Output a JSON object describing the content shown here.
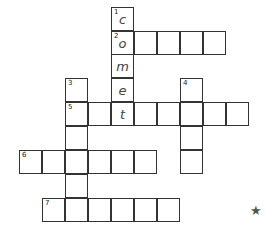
{
  "puzzle": {
    "type": "crossword",
    "clue_numbers": [
      "1",
      "2",
      "3",
      "4",
      "5",
      "6",
      "7"
    ],
    "cells": [
      {
        "x": 111,
        "y": 7,
        "num": "1",
        "letter": "c"
      },
      {
        "x": 111,
        "y": 31,
        "num": "2",
        "letter": "o"
      },
      {
        "x": 134,
        "y": 31
      },
      {
        "x": 157,
        "y": 31
      },
      {
        "x": 180,
        "y": 31
      },
      {
        "x": 203,
        "y": 31
      },
      {
        "x": 111,
        "y": 54,
        "letter": "m"
      },
      {
        "x": 65,
        "y": 78,
        "num": "3"
      },
      {
        "x": 111,
        "y": 78,
        "letter": "e"
      },
      {
        "x": 180,
        "y": 78,
        "num": "4"
      },
      {
        "x": 65,
        "y": 102,
        "num": "5"
      },
      {
        "x": 88,
        "y": 102
      },
      {
        "x": 111,
        "y": 102,
        "letter": "t"
      },
      {
        "x": 134,
        "y": 102
      },
      {
        "x": 157,
        "y": 102
      },
      {
        "x": 180,
        "y": 102
      },
      {
        "x": 203,
        "y": 102
      },
      {
        "x": 226,
        "y": 102
      },
      {
        "x": 65,
        "y": 126
      },
      {
        "x": 180,
        "y": 126
      },
      {
        "x": 19,
        "y": 150,
        "num": "6"
      },
      {
        "x": 42,
        "y": 150
      },
      {
        "x": 65,
        "y": 150
      },
      {
        "x": 88,
        "y": 150
      },
      {
        "x": 111,
        "y": 150
      },
      {
        "x": 134,
        "y": 150
      },
      {
        "x": 180,
        "y": 150
      },
      {
        "x": 65,
        "y": 174
      },
      {
        "x": 42,
        "y": 198,
        "num": "7"
      },
      {
        "x": 65,
        "y": 198
      },
      {
        "x": 88,
        "y": 198
      },
      {
        "x": 111,
        "y": 198
      },
      {
        "x": 134,
        "y": 198
      },
      {
        "x": 157,
        "y": 198
      }
    ],
    "star_icon": "★"
  }
}
